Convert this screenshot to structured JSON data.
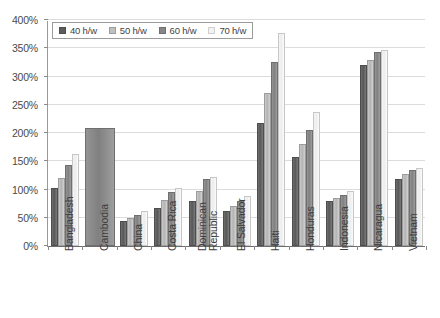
{
  "chart_data": {
    "type": "bar",
    "title": "",
    "subtitle": "",
    "xlabel": "",
    "ylabel": "",
    "ylim": [
      0,
      400
    ],
    "ytick_labels": [
      "0%",
      "50%",
      "100%",
      "150%",
      "200%",
      "250%",
      "300%",
      "350%",
      "400%"
    ],
    "ytick_values": [
      0,
      50,
      100,
      150,
      200,
      250,
      300,
      350,
      400
    ],
    "grid": true,
    "legend_position": "top-left",
    "value_suffix": "%",
    "categories": [
      "Bangladesh",
      "Cambodia",
      "China",
      "Costa Rica",
      "Dominican Republic",
      "El Salvador",
      "Haiti",
      "Honduras",
      "Indonesia",
      "Nicaragua",
      "Vietnam"
    ],
    "series": [
      {
        "name": "40 h/w",
        "color": "#5c5c5c",
        "values": [
          103,
          null,
          45,
          68,
          80,
          62,
          217,
          158,
          80,
          320,
          118
        ]
      },
      {
        "name": "50 h/w",
        "color": "#c0c0c0",
        "values": [
          120,
          null,
          50,
          82,
          97,
          70,
          270,
          180,
          85,
          330,
          128
        ]
      },
      {
        "name": "60 h/w",
        "color": "#878787",
        "values": [
          143,
          208,
          55,
          95,
          118,
          80,
          325,
          205,
          90,
          343,
          135
        ]
      },
      {
        "name": "70 h/w",
        "color": "#f2f2f2",
        "values": [
          163,
          null,
          62,
          103,
          123,
          88,
          377,
          238,
          97,
          347,
          138
        ]
      }
    ]
  }
}
